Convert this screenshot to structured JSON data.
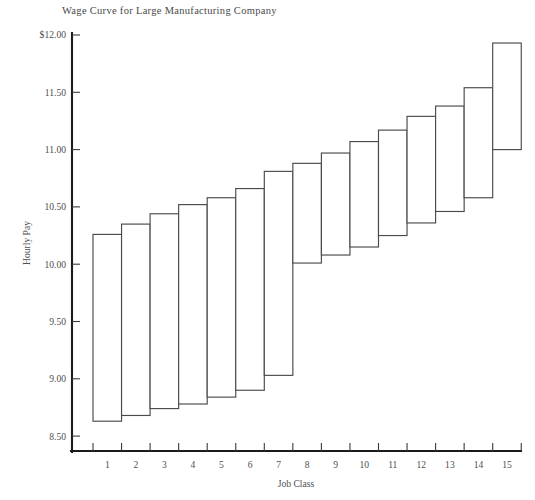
{
  "chart_data": {
    "type": "bar",
    "title": "Wage Curve for Large Manufacturing Company",
    "xlabel": "Job Class",
    "ylabel": "Hourly Pay",
    "grid": false,
    "legend": null,
    "xlim": [
      0.5,
      15.5
    ],
    "ylim": [
      8.28,
      12.0
    ],
    "ytick_labels": [
      "$12.00",
      "11.50",
      "11.00",
      "10.50",
      "10.00",
      "9.50",
      "9.00",
      "8.50"
    ],
    "ytick_values": [
      12.0,
      11.5,
      11.0,
      10.5,
      10.0,
      9.5,
      9.0,
      8.5
    ],
    "xtick_labels": [
      "1",
      "2",
      "3",
      "4",
      "5",
      "6",
      "7",
      "8",
      "9",
      "10",
      "11",
      "12",
      "13",
      "14",
      "15"
    ],
    "categories": [
      "1",
      "2",
      "3",
      "4",
      "5",
      "6",
      "7",
      "8",
      "9",
      "10",
      "11",
      "12",
      "13",
      "14",
      "15"
    ],
    "series": [
      {
        "name": "Range minimum",
        "values": [
          8.63,
          8.68,
          8.74,
          8.78,
          8.84,
          8.9,
          9.03,
          10.01,
          10.08,
          10.15,
          10.25,
          10.36,
          10.46,
          10.58,
          11.0
        ]
      },
      {
        "name": "Range maximum",
        "values": [
          10.26,
          10.35,
          10.44,
          10.52,
          10.58,
          10.66,
          10.81,
          10.88,
          10.97,
          11.07,
          11.17,
          11.29,
          11.38,
          11.54,
          11.93
        ]
      }
    ],
    "ranges": [
      {
        "job_class": "1",
        "min": 8.63,
        "max": 10.26
      },
      {
        "job_class": "2",
        "min": 8.68,
        "max": 10.35
      },
      {
        "job_class": "3",
        "min": 8.74,
        "max": 10.44
      },
      {
        "job_class": "4",
        "min": 8.78,
        "max": 10.52
      },
      {
        "job_class": "5",
        "min": 8.84,
        "max": 10.58
      },
      {
        "job_class": "6",
        "min": 8.9,
        "max": 10.66
      },
      {
        "job_class": "7",
        "min": 9.03,
        "max": 10.81
      },
      {
        "job_class": "8",
        "min": 10.01,
        "max": 10.88
      },
      {
        "job_class": "9",
        "min": 10.08,
        "max": 10.97
      },
      {
        "job_class": "10",
        "min": 10.15,
        "max": 11.07
      },
      {
        "job_class": "11",
        "min": 10.25,
        "max": 11.17
      },
      {
        "job_class": "12",
        "min": 10.36,
        "max": 11.29
      },
      {
        "job_class": "13",
        "min": 10.46,
        "max": 11.38
      },
      {
        "job_class": "14",
        "min": 10.58,
        "max": 11.54
      },
      {
        "job_class": "15",
        "min": 11.0,
        "max": 11.93
      }
    ]
  }
}
